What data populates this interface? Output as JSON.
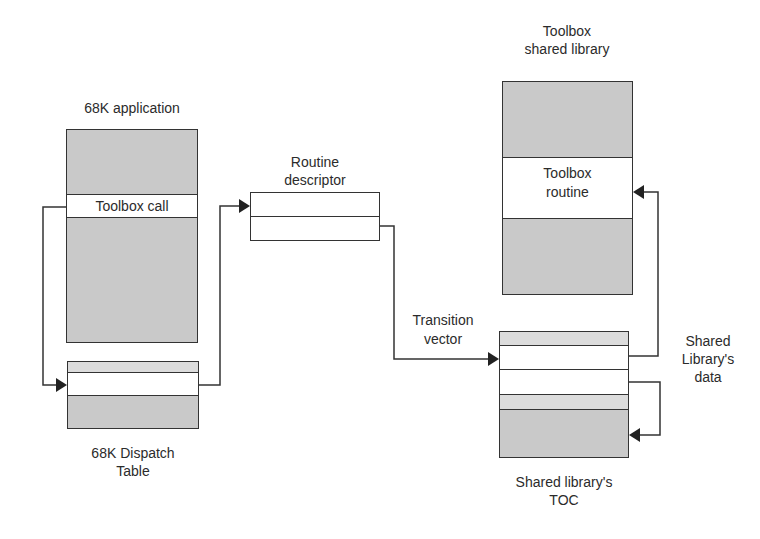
{
  "diagram": {
    "title": "",
    "nodes": {
      "app": {
        "label": "68K application",
        "band_label": "Toolbox call"
      },
      "dispatch": {
        "label_line1": "68K Dispatch",
        "label_line2": "Table"
      },
      "descriptor": {
        "label_line1": "Routine",
        "label_line2": "descriptor"
      },
      "transition": {
        "label_line1": "Transition",
        "label_line2": "vector"
      },
      "toolbox_lib": {
        "label_line1": "Toolbox",
        "label_line2": "shared library",
        "band_line1": "Toolbox",
        "band_line2": "routine"
      },
      "toc": {
        "label_line1": "Shared library's",
        "label_line2": "TOC"
      },
      "lib_data": {
        "label_line1": "Shared",
        "label_line2": "Library's",
        "label_line3": "data"
      }
    },
    "edges": [
      {
        "from": "app.toolbox_call",
        "to": "dispatch.entry"
      },
      {
        "from": "dispatch.entry",
        "to": "descriptor.top"
      },
      {
        "from": "descriptor.bottom",
        "to": "toc.entry"
      },
      {
        "from": "toc.entry",
        "to": "toolbox_lib.routine"
      },
      {
        "from": "toc.second",
        "to": "toc.data"
      }
    ],
    "colors": {
      "fill_grey": "#c9c9c9",
      "fill_light": "#dcdcdc",
      "line": "#333333"
    }
  }
}
